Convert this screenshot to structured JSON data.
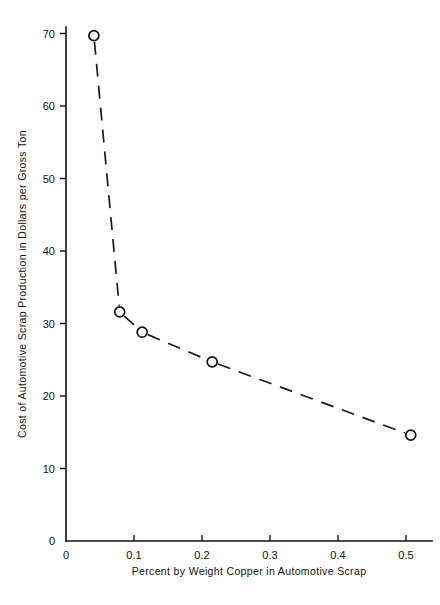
{
  "chart_data": {
    "type": "line",
    "title": "",
    "xlabel": "Percent by Weight Copper in Automotive Scrap",
    "ylabel": "Cost of Automotive Scrap Production in Dollars per Gross Ton",
    "xlim": [
      0,
      0.54
    ],
    "ylim": [
      0,
      71
    ],
    "grid": false,
    "legend": null,
    "marker": "open-circle",
    "line_style": "dashed",
    "x_ticks": [
      0,
      0.1,
      0.2,
      0.3,
      0.4,
      0.5
    ],
    "x_tick_labels": [
      "0",
      "0.1",
      "0.2",
      "0.3",
      "0.4",
      "0.5"
    ],
    "y_ticks": [
      0,
      10,
      20,
      30,
      40,
      50,
      60,
      70
    ],
    "y_tick_labels": [
      "0",
      "10",
      "20",
      "30",
      "40",
      "50",
      "60",
      "70"
    ],
    "x": [
      0.041,
      0.079,
      0.112,
      0.215,
      0.507
    ],
    "values": [
      69.7,
      31.6,
      28.8,
      24.7,
      14.6
    ],
    "points": [
      {
        "x": 0.041,
        "y": 69.7
      },
      {
        "x": 0.079,
        "y": 31.6
      },
      {
        "x": 0.112,
        "y": 28.8
      },
      {
        "x": 0.215,
        "y": 24.7
      },
      {
        "x": 0.507,
        "y": 14.6
      }
    ]
  },
  "axes": {
    "x_axis_name": "x-axis",
    "y_axis_name": "y-axis"
  }
}
